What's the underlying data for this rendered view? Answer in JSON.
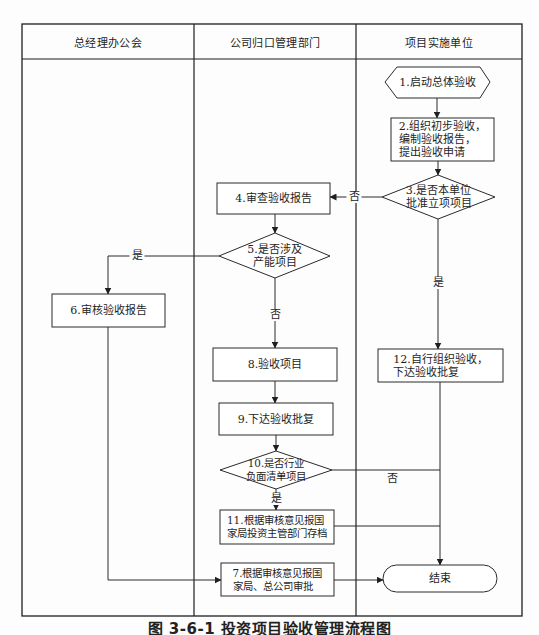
{
  "lanes": [
    {
      "id": "general-manager-office",
      "label": "总经理办公会"
    },
    {
      "id": "management-department",
      "label": "公司归口管理部门"
    },
    {
      "id": "implementing-unit",
      "label": "项目实施单位"
    }
  ],
  "nodes": {
    "n1": {
      "shape": "hexagon",
      "lane": 2,
      "lines": [
        "1.启动总体验收"
      ]
    },
    "n2": {
      "shape": "process",
      "lane": 2,
      "lines": [
        "2.组织初步验收，",
        "编制验收报告，",
        "提出验收申请"
      ]
    },
    "n3": {
      "shape": "decision",
      "lane": 2,
      "lines": [
        "3.是否本单位",
        "批准立项项目"
      ]
    },
    "n4": {
      "shape": "process",
      "lane": 1,
      "lines": [
        "4.审查验收报告"
      ]
    },
    "n5": {
      "shape": "decision",
      "lane": 1,
      "lines": [
        "5.是否涉及",
        "产能项目"
      ]
    },
    "n6": {
      "shape": "process",
      "lane": 0,
      "lines": [
        "6.审核验收报告"
      ]
    },
    "n7": {
      "shape": "process",
      "lane": 1,
      "lines": [
        "7.根据审核意见报国",
        "家局、总公司审批"
      ]
    },
    "n8": {
      "shape": "process",
      "lane": 1,
      "lines": [
        "8.验收项目"
      ]
    },
    "n9": {
      "shape": "process",
      "lane": 1,
      "lines": [
        "9.下达验收批复"
      ]
    },
    "n10": {
      "shape": "decision",
      "lane": 1,
      "lines": [
        "10.是否行业",
        "负面清单项目"
      ]
    },
    "n11": {
      "shape": "process",
      "lane": 1,
      "lines": [
        "11.根据审核意见报国",
        "家局投资主管部门存档"
      ]
    },
    "n12": {
      "shape": "process",
      "lane": 2,
      "lines": [
        "12.自行组织验收，",
        "下达验收批复"
      ]
    },
    "end": {
      "shape": "terminator",
      "lane": 2,
      "lines": [
        "结束"
      ]
    }
  },
  "edges": [
    {
      "from": "n1",
      "to": "n2",
      "label": ""
    },
    {
      "from": "n2",
      "to": "n3",
      "label": ""
    },
    {
      "from": "n3",
      "to": "n4",
      "label": "否"
    },
    {
      "from": "n3",
      "to": "n12",
      "label": "是"
    },
    {
      "from": "n4",
      "to": "n5",
      "label": ""
    },
    {
      "from": "n5",
      "to": "n6",
      "label": "是"
    },
    {
      "from": "n5",
      "to": "n8",
      "label": "否"
    },
    {
      "from": "n6",
      "to": "n7",
      "label": ""
    },
    {
      "from": "n8",
      "to": "n9",
      "label": ""
    },
    {
      "from": "n9",
      "to": "n10",
      "label": ""
    },
    {
      "from": "n10",
      "to": "n11",
      "label": "是"
    },
    {
      "from": "n10",
      "to": "end",
      "label": "否"
    },
    {
      "from": "n11",
      "to": "end",
      "label": ""
    },
    {
      "from": "n12",
      "to": "end",
      "label": ""
    },
    {
      "from": "n7",
      "to": "end",
      "label": ""
    }
  ],
  "caption": "图 3-6-1  投资项目验收管理流程图"
}
